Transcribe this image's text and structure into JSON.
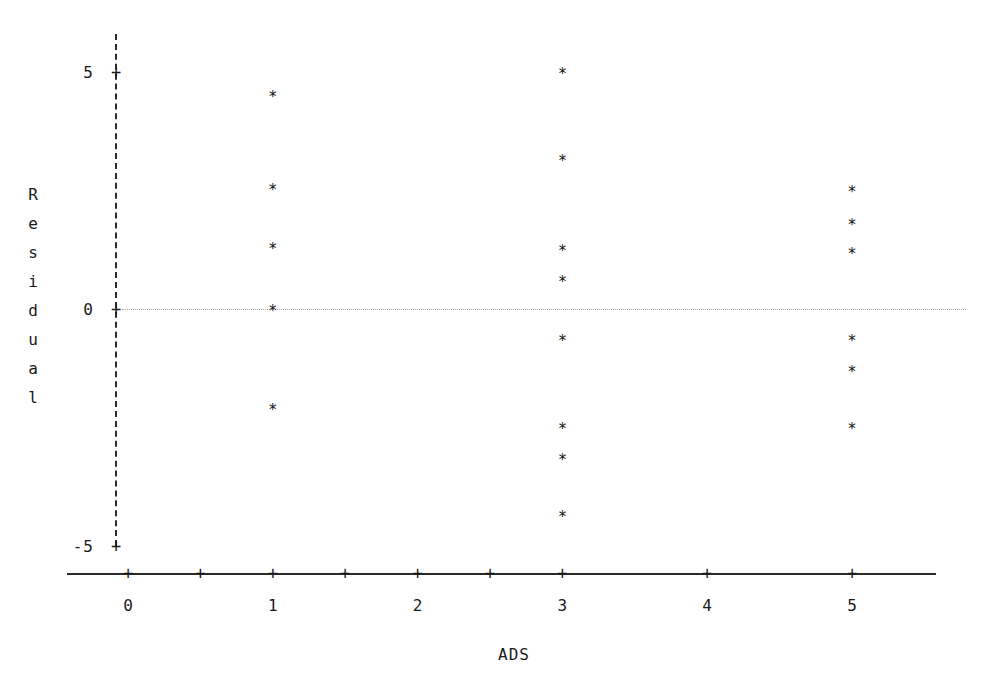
{
  "chart_data": {
    "type": "scatter",
    "title": "",
    "xlabel": "ADS",
    "ylabel": "Residual",
    "ylabel_letters": [
      "R",
      "e",
      "s",
      "i",
      "d",
      "u",
      "a",
      "l"
    ],
    "xlim": [
      -0.45,
      5.6
    ],
    "ylim": [
      -5.6,
      5.9
    ],
    "grid": false,
    "legend": null,
    "reference_line": {
      "axis": "y",
      "value": 0,
      "style": "dotted",
      "color": "#a8a8a8"
    },
    "marker": "*",
    "x_ticks": [
      0,
      0.5,
      1,
      1.5,
      2,
      2.5,
      3,
      4,
      5
    ],
    "x_tick_labels": [
      "0",
      "",
      "1",
      "",
      "2",
      "",
      "3",
      "4",
      "5"
    ],
    "x_major_labels": [
      "0",
      "1",
      "2",
      "3",
      "4",
      "5"
    ],
    "y_ticks": [
      -5,
      0,
      5
    ],
    "y_tick_labels": [
      "-5",
      "0",
      "5"
    ],
    "points": [
      {
        "x": 1,
        "y": 4.55
      },
      {
        "x": 1,
        "y": 2.6
      },
      {
        "x": 1,
        "y": 1.35
      },
      {
        "x": 1,
        "y": 0.05
      },
      {
        "x": 1,
        "y": -2.05
      },
      {
        "x": 3,
        "y": 5.05
      },
      {
        "x": 3,
        "y": 3.2
      },
      {
        "x": 3,
        "y": 1.3
      },
      {
        "x": 3,
        "y": 0.65
      },
      {
        "x": 3,
        "y": -0.6
      },
      {
        "x": 3,
        "y": -2.45
      },
      {
        "x": 3,
        "y": -3.1
      },
      {
        "x": 3,
        "y": -4.3
      },
      {
        "x": 5,
        "y": 2.55
      },
      {
        "x": 5,
        "y": 1.85
      },
      {
        "x": 5,
        "y": 1.25
      },
      {
        "x": 5,
        "y": -0.6
      },
      {
        "x": 5,
        "y": -1.25
      },
      {
        "x": 5,
        "y": -2.45
      }
    ],
    "series": [
      {
        "name": "Residuals vs ADS",
        "x": [
          1,
          1,
          1,
          1,
          1,
          3,
          3,
          3,
          3,
          3,
          3,
          3,
          3,
          5,
          5,
          5,
          5,
          5,
          5
        ],
        "y": [
          4.55,
          2.6,
          1.35,
          0.05,
          -2.05,
          5.05,
          3.2,
          1.3,
          0.65,
          -0.6,
          -2.45,
          -3.1,
          -4.3,
          2.55,
          1.85,
          1.25,
          -0.6,
          -1.25,
          -2.45
        ]
      }
    ],
    "point_counts_by_x": {
      "1": 5,
      "3": 8,
      "5": 6
    },
    "colors": {
      "axis": "#2b2b2b",
      "marker": "#111111",
      "reference_line": "#a8a8a8",
      "text": "#1a1a1a",
      "background": "#ffffff"
    }
  }
}
